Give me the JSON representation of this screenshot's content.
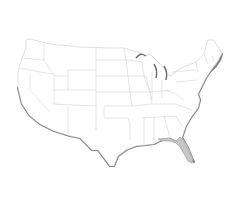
{
  "map": {
    "type": "us-states-outline",
    "background": "#ffffff",
    "state_fill": "#ffffff",
    "state_stroke": "#b8b8b8",
    "coast_shadow": "#555555",
    "highlighted_states": [
      {
        "name": "Florida",
        "fill": "#c6c6c6"
      }
    ]
  }
}
